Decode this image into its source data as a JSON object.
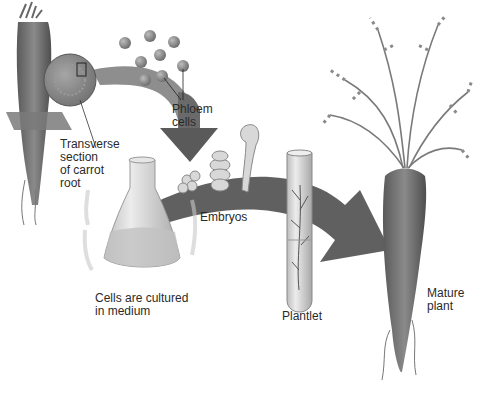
{
  "diagram": {
    "type": "process-flow",
    "stages": [
      {
        "id": "root",
        "label": "Transverse\nsection\nof carrot\nroot"
      },
      {
        "id": "phloem",
        "label": "Phloem\ncells"
      },
      {
        "id": "culture",
        "label": "Cells are cultured\nin medium"
      },
      {
        "id": "embryos",
        "label": "Embryos"
      },
      {
        "id": "plantlet",
        "label": "Plantlet"
      },
      {
        "id": "mature",
        "label": "Mature\nplant"
      }
    ],
    "colors": {
      "background": "#ffffff",
      "arrow": "#5a5a5a",
      "carrot": "#6e6e6e",
      "foliage": "#8a8a8a",
      "cells": "#8c8c8c",
      "glass": "#d6d6d6",
      "text": "#2a2a2a"
    }
  }
}
